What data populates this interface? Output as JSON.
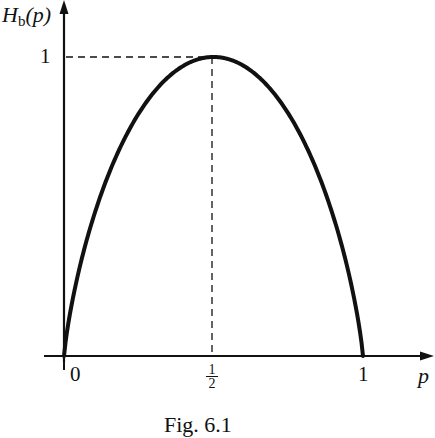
{
  "chart_data": {
    "type": "line",
    "title": "",
    "caption": "Fig. 6.1",
    "xlabel": "p",
    "ylabel": "H_b(p)",
    "xlim": [
      0,
      1
    ],
    "ylim": [
      0,
      1
    ],
    "grid": false,
    "xticks": [
      "0",
      "1/2",
      "1"
    ],
    "yticks": [
      "1"
    ],
    "annotations": [
      "dashed guide from (0,1) to (1/2,1)",
      "dashed guide from (1/2,0) to (1/2,1)"
    ],
    "series": [
      {
        "name": "H_b(p) binary entropy",
        "x": [
          0,
          0.05,
          0.1,
          0.2,
          0.3,
          0.4,
          0.5,
          0.6,
          0.7,
          0.8,
          0.9,
          0.95,
          1
        ],
        "y": [
          0,
          0.286,
          0.469,
          0.722,
          0.881,
          0.971,
          1.0,
          0.971,
          0.881,
          0.722,
          0.469,
          0.286,
          0
        ]
      }
    ]
  },
  "labels": {
    "y_axis_H": "H",
    "y_axis_sub": "b",
    "y_axis_arg": "(p)",
    "y_tick_1": "1",
    "x_tick_0": "0",
    "x_tick_half_num": "1",
    "x_tick_half_den": "2",
    "x_tick_1": "1",
    "x_axis": "p",
    "caption": "Fig. 6.1"
  }
}
